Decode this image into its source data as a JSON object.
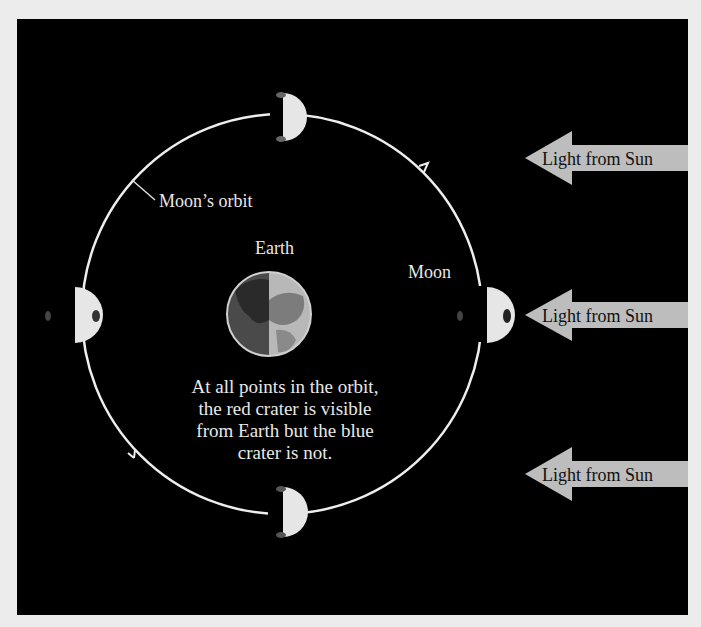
{
  "labels": {
    "orbit": "Moon’s orbit",
    "earth": "Earth",
    "moon": "Moon"
  },
  "caption": {
    "line1": "At all points in the orbit,",
    "line2": "the red crater is visible",
    "line3": "from Earth but the blue",
    "line4": "crater is not."
  },
  "sunlight": [
    {
      "label": "Light from Sun"
    },
    {
      "label": "Light from Sun"
    },
    {
      "label": "Light from Sun"
    }
  ],
  "colors": {
    "background": "#000000",
    "frame": "#ececec",
    "orbit": "#eeeeee",
    "arrow": "#bdbdbd",
    "moon_lit": "#e6e6e6"
  }
}
